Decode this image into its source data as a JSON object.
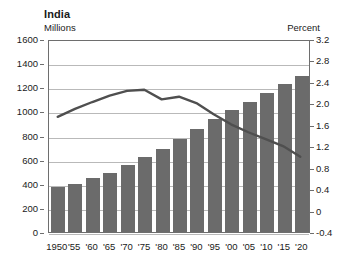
{
  "chart_data": {
    "type": "bar",
    "title": "India",
    "subtitle": "",
    "ylabel": "Millions",
    "y2label": "Percent",
    "xlabel": "",
    "categories": [
      "1950",
      "'55",
      "'60",
      "'65",
      "'70",
      "'75",
      "'80",
      "'85",
      "'90",
      "'95",
      "'00",
      "'05",
      "'10",
      "'15",
      "'20"
    ],
    "ylim": [
      0,
      1600
    ],
    "y2lim": [
      -0.4,
      3.2
    ],
    "yticks": [
      "1600",
      "1400",
      "1200",
      "1000",
      "800",
      "600",
      "400",
      "200",
      "0"
    ],
    "ytick_values": [
      1600,
      1400,
      1200,
      1000,
      800,
      600,
      400,
      200,
      0
    ],
    "y2ticks": [
      "3.2",
      "2.8",
      "2.4",
      "2.0",
      "1.6",
      "1.2",
      "0.8",
      "0.4",
      "0",
      "-0.4"
    ],
    "y2tick_values": [
      3.2,
      2.8,
      2.4,
      2.0,
      1.6,
      1.2,
      0.8,
      0.4,
      0,
      -0.4
    ],
    "grid": true,
    "legend": "none",
    "series": [
      {
        "name": "Population",
        "type": "bar",
        "axis": "left",
        "unit": "Millions",
        "color": "#6b6b6b",
        "values": [
          370,
          400,
          445,
          490,
          555,
          620,
          690,
          770,
          850,
          935,
          1010,
          1080,
          1155,
          1225,
          1290
        ]
      },
      {
        "name": "Growth rate",
        "type": "line",
        "axis": "right",
        "unit": "Percent",
        "color": "#4f4f4f",
        "values": [
          1.77,
          1.92,
          2.05,
          2.17,
          2.26,
          2.28,
          2.1,
          2.15,
          2.03,
          1.82,
          1.63,
          1.48,
          1.35,
          1.22,
          1.02
        ]
      }
    ]
  },
  "header": {
    "title": "India",
    "left_unit": "Millions",
    "right_unit": "Percent"
  }
}
